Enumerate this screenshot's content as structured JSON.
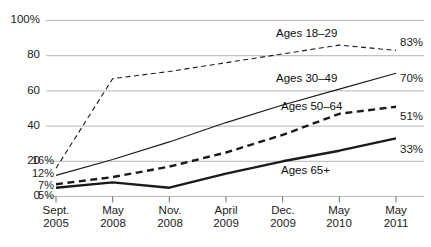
{
  "chart_data": {
    "type": "line",
    "title": "",
    "subtitle": "",
    "xlabel": "",
    "ylabel": "",
    "ylim": [
      0,
      100
    ],
    "grid": true,
    "legend_position": "inline-annotations",
    "categories": [
      "Sept. 2005",
      "May 2008",
      "Nov. 2008",
      "April 2009",
      "Dec. 2009",
      "May 2010",
      "May 2011"
    ],
    "category_lines": [
      [
        "Sept.",
        "2005"
      ],
      [
        "May",
        "2008"
      ],
      [
        "Nov.",
        "2008"
      ],
      [
        "April",
        "2009"
      ],
      [
        "Dec.",
        "2009"
      ],
      [
        "May",
        "2010"
      ],
      [
        "May",
        "2011"
      ]
    ],
    "ytick_labels": [
      "100%",
      "80",
      "60",
      "40",
      "20",
      "0"
    ],
    "ytick_values": [
      100,
      80,
      60,
      40,
      20,
      0
    ],
    "series": [
      {
        "name": "Ages 18–29",
        "label": "Ages 18–29",
        "style": "dashed-thin",
        "values": [
          16,
          67,
          71,
          76,
          81,
          86,
          83
        ],
        "start_label": "16%",
        "end_label": "83%"
      },
      {
        "name": "Ages 30–49",
        "label": "Ages 30–49",
        "style": "solid-thin",
        "values": [
          12,
          21,
          31,
          42,
          52,
          61,
          70
        ],
        "start_label": "12%",
        "end_label": "70%"
      },
      {
        "name": "Ages 50–64",
        "label": "Ages 50–64",
        "style": "dashed-thick",
        "values": [
          7,
          11,
          17,
          25,
          35,
          47,
          51
        ],
        "start_label": "7%",
        "end_label": "51%"
      },
      {
        "name": "Ages 65+",
        "label": "Ages 65+",
        "style": "solid-thick",
        "values": [
          5,
          8,
          5,
          13,
          20,
          26,
          33
        ],
        "start_label": "5%",
        "end_label": "33%"
      }
    ]
  },
  "colors": {
    "line": "#1a1a1a",
    "grid": "#b6b6b6",
    "axis": "#6e6e6e",
    "text": "#151515",
    "background": "#ffffff"
  }
}
